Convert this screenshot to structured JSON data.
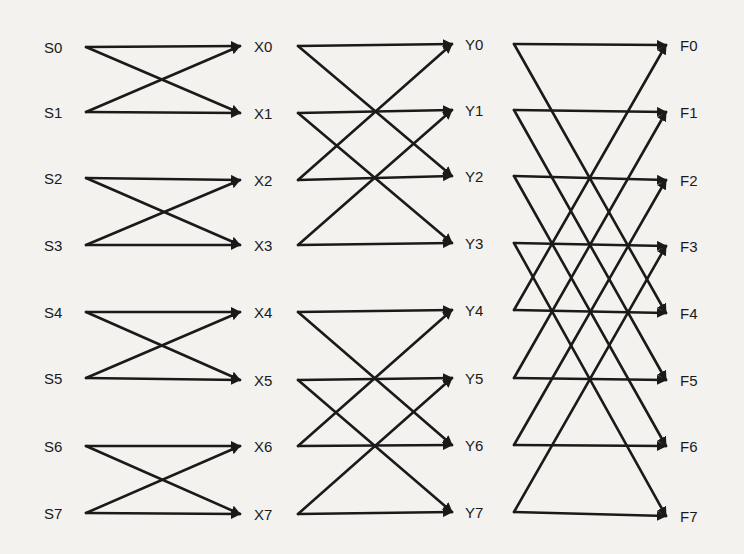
{
  "diagram": {
    "stroke_color": "#1a1a1a",
    "background_color": "#f3f2ef",
    "columns": [
      {
        "id": "S",
        "labels": [
          "S0",
          "S1",
          "S2",
          "S3",
          "S4",
          "S5",
          "S6",
          "S7"
        ],
        "label_x": 44,
        "ys": [
          47,
          112,
          178,
          245,
          312,
          378,
          446,
          513
        ]
      },
      {
        "id": "X",
        "labels": [
          "X0",
          "X1",
          "X2",
          "X3",
          "X4",
          "X5",
          "X6",
          "X7"
        ],
        "label_x": 254,
        "ys": [
          46,
          113,
          180,
          245,
          312,
          380,
          446,
          514
        ]
      },
      {
        "id": "Y",
        "labels": [
          "Y0",
          "Y1",
          "Y2",
          "Y3",
          "Y4",
          "Y5",
          "Y6",
          "Y7"
        ],
        "label_x": 465,
        "ys": [
          44,
          110,
          176,
          243,
          310,
          378,
          445,
          512
        ]
      },
      {
        "id": "F",
        "labels": [
          "F0",
          "F1",
          "F2",
          "F3",
          "F4",
          "F5",
          "F6",
          "F7"
        ],
        "label_x": 680,
        "ys": [
          45,
          112,
          180,
          246,
          313,
          380,
          446,
          516
        ]
      }
    ],
    "stages": [
      {
        "from": "S",
        "to": "X",
        "x_start": 86,
        "x_end": 240,
        "span": 1
      },
      {
        "from": "X",
        "to": "Y",
        "x_start": 298,
        "x_end": 452,
        "span": 2
      },
      {
        "from": "Y",
        "to": "F",
        "x_start": 514,
        "x_end": 666,
        "span": 4
      }
    ]
  }
}
